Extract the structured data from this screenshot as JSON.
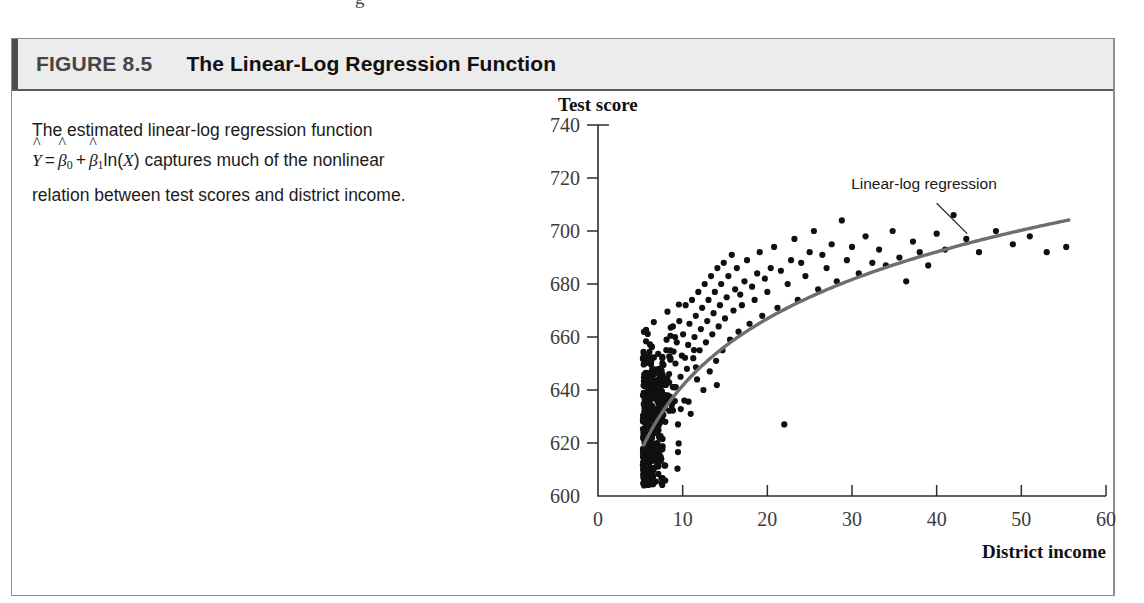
{
  "page": {
    "bleed_glyph": "g"
  },
  "figure": {
    "number_label": "FIGURE 8.5",
    "title": "The Linear-Log Regression Function",
    "caption": {
      "line1": "The estimated linear-log regression function",
      "formula": {
        "y_hat": "Y",
        "hat": "^",
        "equals": "=",
        "beta": "β",
        "sub0": "0",
        "sub1": "1",
        "plus": "+",
        "ln_open": "ln(",
        "x": "X",
        "ln_close": ")"
      },
      "line2_tail": "captures much of the nonlinear",
      "line3": "relation between test scores and district income."
    }
  },
  "chart_data": {
    "type": "scatter",
    "title": "",
    "ylabel": "Test score",
    "xlabel": "District income",
    "xlim": [
      0,
      60
    ],
    "ylim": [
      600,
      740
    ],
    "xticks": [
      0,
      10,
      20,
      30,
      40,
      50,
      60
    ],
    "yticks": [
      600,
      620,
      640,
      660,
      680,
      700,
      720,
      740
    ],
    "grid": false,
    "legend": false,
    "annotations": [
      {
        "text": "Linear-log regression",
        "x": 38.5,
        "y": 716,
        "leader_from": [
          40.0,
          710.5
        ],
        "leader_to": [
          43.6,
          699.0
        ]
      }
    ],
    "series": [
      {
        "name": "Districts",
        "type": "scatter",
        "marker_color": "#101010",
        "marker_size": 5.0,
        "n_points": 420,
        "x_range": [
          5.3,
          55.5
        ],
        "scatter_model": {
          "x_lognormal_mu": 2.62,
          "x_lognormal_sigma": 0.42,
          "residual_sd": 13.0,
          "residual_sd_low_income": 15.5,
          "seed": 20250818
        }
      },
      {
        "name": "Linear-log regression",
        "type": "line",
        "line_color": "#6e6e6e",
        "line_width": 3.4,
        "equation": "Yhat = b0 + b1*ln(X)",
        "b0": 557.8,
        "b1": 36.42,
        "x_start": 5.4,
        "x_end": 55.6
      }
    ],
    "sample_points": [
      [
        5.34,
        616
      ],
      [
        5.5,
        620
      ],
      [
        5.62,
        611
      ],
      [
        5.8,
        626
      ],
      [
        5.9,
        633
      ],
      [
        6.1,
        608
      ],
      [
        6.2,
        619
      ],
      [
        6.35,
        629
      ],
      [
        6.5,
        637
      ],
      [
        6.6,
        614
      ],
      [
        6.75,
        624
      ],
      [
        6.9,
        641
      ],
      [
        7.05,
        632
      ],
      [
        7.2,
        648
      ],
      [
        7.35,
        622
      ],
      [
        7.5,
        636
      ],
      [
        7.6,
        652
      ],
      [
        7.8,
        644
      ],
      [
        7.95,
        628
      ],
      [
        8.1,
        659
      ],
      [
        8.25,
        638
      ],
      [
        8.4,
        646
      ],
      [
        8.55,
        655
      ],
      [
        8.7,
        633
      ],
      [
        8.85,
        664
      ],
      [
        9.0,
        641
      ],
      [
        9.15,
        650
      ],
      [
        9.3,
        658
      ],
      [
        9.45,
        627
      ],
      [
        9.6,
        666
      ],
      [
        9.75,
        645
      ],
      [
        9.9,
        653
      ],
      [
        10.05,
        661
      ],
      [
        10.2,
        636
      ],
      [
        10.35,
        672
      ],
      [
        10.5,
        648
      ],
      [
        10.65,
        657
      ],
      [
        10.8,
        665
      ],
      [
        10.95,
        631
      ],
      [
        11.1,
        674
      ],
      [
        11.25,
        652
      ],
      [
        11.4,
        660
      ],
      [
        11.55,
        668
      ],
      [
        11.7,
        644
      ],
      [
        11.85,
        677
      ],
      [
        12.0,
        655
      ],
      [
        12.15,
        663
      ],
      [
        12.3,
        671
      ],
      [
        12.45,
        640
      ],
      [
        12.6,
        680
      ],
      [
        12.75,
        658
      ],
      [
        12.9,
        666
      ],
      [
        13.05,
        674
      ],
      [
        13.2,
        647
      ],
      [
        13.35,
        683
      ],
      [
        13.5,
        661
      ],
      [
        13.65,
        669
      ],
      [
        13.8,
        677
      ],
      [
        13.95,
        651
      ],
      [
        14.1,
        686
      ],
      [
        14.25,
        664
      ],
      [
        14.4,
        672
      ],
      [
        14.55,
        680
      ],
      [
        14.7,
        655
      ],
      [
        14.85,
        688
      ],
      [
        15.0,
        667
      ],
      [
        15.2,
        675
      ],
      [
        15.4,
        683
      ],
      [
        15.6,
        659
      ],
      [
        15.8,
        691
      ],
      [
        16.0,
        670
      ],
      [
        16.2,
        678
      ],
      [
        16.4,
        686
      ],
      [
        16.6,
        662
      ],
      [
        16.8,
        676
      ],
      [
        17.0,
        672
      ],
      [
        17.3,
        681
      ],
      [
        17.6,
        689
      ],
      [
        17.9,
        665
      ],
      [
        18.2,
        679
      ],
      [
        18.5,
        674
      ],
      [
        18.8,
        684
      ],
      [
        19.1,
        692
      ],
      [
        19.4,
        668
      ],
      [
        19.7,
        682
      ],
      [
        20.0,
        677
      ],
      [
        20.4,
        686
      ],
      [
        20.8,
        694
      ],
      [
        21.2,
        671
      ],
      [
        21.6,
        685
      ],
      [
        22.0,
        627
      ],
      [
        22.4,
        680
      ],
      [
        22.8,
        689
      ],
      [
        23.2,
        697
      ],
      [
        23.6,
        674
      ],
      [
        24.0,
        688
      ],
      [
        24.5,
        683
      ],
      [
        25.0,
        692
      ],
      [
        25.5,
        700
      ],
      [
        26.0,
        678
      ],
      [
        26.5,
        691
      ],
      [
        27.0,
        686
      ],
      [
        27.6,
        695
      ],
      [
        28.2,
        681
      ],
      [
        28.8,
        704
      ],
      [
        29.4,
        689
      ],
      [
        30.0,
        694
      ],
      [
        30.8,
        684
      ],
      [
        31.6,
        698
      ],
      [
        32.4,
        688
      ],
      [
        33.2,
        693
      ],
      [
        34.0,
        687
      ],
      [
        34.8,
        700
      ],
      [
        35.6,
        690
      ],
      [
        36.4,
        681
      ],
      [
        37.2,
        696
      ],
      [
        38.0,
        692
      ],
      [
        39.0,
        687
      ],
      [
        40.0,
        699
      ],
      [
        41.0,
        693
      ],
      [
        42.0,
        706
      ],
      [
        43.5,
        697
      ],
      [
        45.0,
        692
      ],
      [
        47.0,
        700
      ],
      [
        49.0,
        695
      ],
      [
        51.0,
        698
      ],
      [
        53.0,
        692
      ],
      [
        55.3,
        694
      ]
    ]
  }
}
